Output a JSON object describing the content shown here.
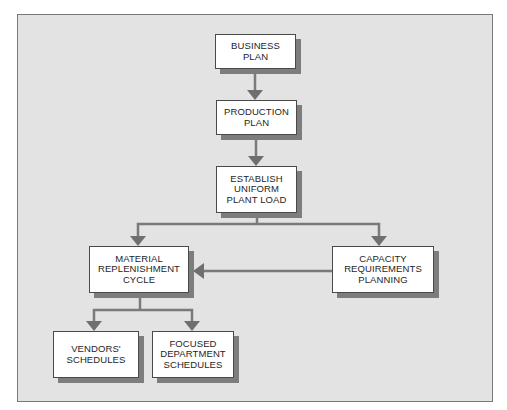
{
  "diagram": {
    "type": "flowchart",
    "colors": {
      "background": "#e3e3e3",
      "box_fill": "#ffffff",
      "box_border": "#4a4a4a",
      "shadow": "#7d7d7d",
      "connector": "#7a7a7a",
      "frame_border": "#7a7a7a"
    },
    "nodes": {
      "business_plan": "BUSINESS\nPLAN",
      "production_plan": "PRODUCTION\nPLAN",
      "establish_load": "ESTABLISH\nUNIFORM\nPLANT LOAD",
      "material_cycle": "MATERIAL\nREPLENISHMENT\nCYCLE",
      "capacity_planning": "CAPACITY\nREQUIREMENTS\nPLANNING",
      "vendors_schedules": "VENDORS'\nSCHEDULES",
      "focused_schedules": "FOCUSED\nDEPARTMENT\nSCHEDULES"
    },
    "edges": [
      {
        "from": "business_plan",
        "to": "production_plan"
      },
      {
        "from": "production_plan",
        "to": "establish_load"
      },
      {
        "from": "establish_load",
        "to": "material_cycle"
      },
      {
        "from": "establish_load",
        "to": "capacity_planning"
      },
      {
        "from": "capacity_planning",
        "to": "material_cycle"
      },
      {
        "from": "material_cycle",
        "to": "vendors_schedules"
      },
      {
        "from": "material_cycle",
        "to": "focused_schedules"
      }
    ]
  }
}
